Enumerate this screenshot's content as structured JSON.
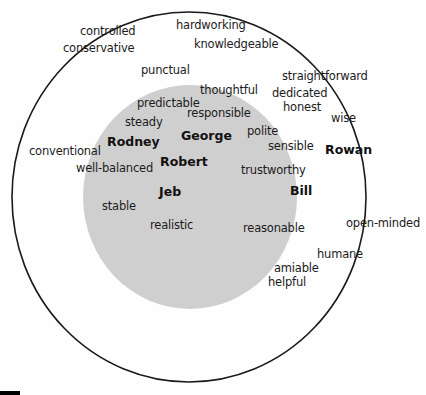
{
  "diagram": {
    "type": "nested-circles",
    "colors": {
      "outer_circle_stroke": "#1a1a1a",
      "inner_circle_fill": "#cfcfcf",
      "background": "#fefefe"
    },
    "outer_circle": {
      "cx": 189,
      "cy": 197,
      "rx": 177,
      "ry": 185
    },
    "inner_circle": {
      "cx": 190,
      "cy": 197,
      "rx": 107,
      "ry": 112
    },
    "names": [
      {
        "label": "Rodney",
        "x": 107,
        "y": 135
      },
      {
        "label": "George",
        "x": 181,
        "y": 129
      },
      {
        "label": "Robert",
        "x": 160,
        "y": 155
      },
      {
        "label": "Jeb",
        "x": 159,
        "y": 185
      },
      {
        "label": "Bill",
        "x": 290,
        "y": 184
      },
      {
        "label": "Rowan",
        "x": 325,
        "y": 143
      }
    ],
    "words": [
      {
        "label": "controlled",
        "x": 80,
        "y": 25
      },
      {
        "label": "conservative",
        "x": 63,
        "y": 42
      },
      {
        "label": "hardworking",
        "x": 176,
        "y": 19
      },
      {
        "label": "knowledgeable",
        "x": 194,
        "y": 38
      },
      {
        "label": "punctual",
        "x": 141,
        "y": 64
      },
      {
        "label": "straightforward",
        "x": 282,
        "y": 70
      },
      {
        "label": "thoughtful",
        "x": 200,
        "y": 84
      },
      {
        "label": "dedicated",
        "x": 272,
        "y": 87
      },
      {
        "label": "predictable",
        "x": 137,
        "y": 97
      },
      {
        "label": "honest",
        "x": 283,
        "y": 101
      },
      {
        "label": "responsible",
        "x": 187,
        "y": 107
      },
      {
        "label": "wise",
        "x": 331,
        "y": 112
      },
      {
        "label": "steady",
        "x": 125,
        "y": 116
      },
      {
        "label": "polite",
        "x": 247,
        "y": 125
      },
      {
        "label": "sensible",
        "x": 268,
        "y": 140
      },
      {
        "label": "conventional",
        "x": 29,
        "y": 145
      },
      {
        "label": "well-balanced",
        "x": 76,
        "y": 162
      },
      {
        "label": "trustworthy",
        "x": 241,
        "y": 164
      },
      {
        "label": "stable",
        "x": 102,
        "y": 200
      },
      {
        "label": "realistic",
        "x": 150,
        "y": 219
      },
      {
        "label": "reasonable",
        "x": 243,
        "y": 222
      },
      {
        "label": "open-minded",
        "x": 346,
        "y": 217
      },
      {
        "label": "humane",
        "x": 317,
        "y": 248
      },
      {
        "label": "amiable",
        "x": 274,
        "y": 262
      },
      {
        "label": "helpful",
        "x": 268,
        "y": 276
      }
    ]
  }
}
